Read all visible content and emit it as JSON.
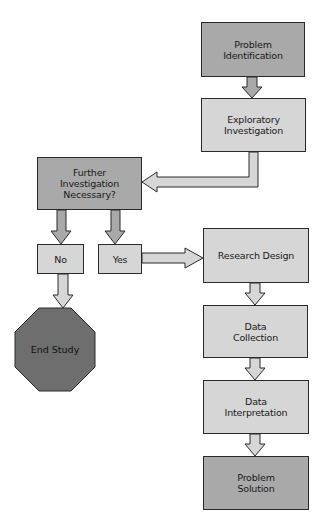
{
  "diagram": {
    "type": "flowchart",
    "colors": {
      "dark_fill": "#a9a9a9",
      "light_fill": "#d6d6d6",
      "terminal_fill": "#6e6e6e",
      "stroke": "#2a2a2a"
    },
    "nodes": {
      "problem_identification": {
        "line1": "Problem",
        "line2": "Identification"
      },
      "exploratory_investigation": {
        "line1": "Exploratory",
        "line2": "Investigation"
      },
      "further_investigation": {
        "line1": "Further",
        "line2": "Investigation",
        "line3": "Necessary?"
      },
      "no": {
        "label": "No"
      },
      "yes": {
        "label": "Yes"
      },
      "end_study": {
        "line1": "End",
        "line2": "Study"
      },
      "research_design": {
        "label": "Research Design"
      },
      "data_collection": {
        "line1": "Data",
        "line2": "Collection"
      },
      "data_interpretation": {
        "line1": "Data",
        "line2": "Interpretation"
      },
      "problem_solution": {
        "line1": "Problem",
        "line2": "Solution"
      }
    },
    "edges": [
      {
        "from": "Problem Identification",
        "to": "Exploratory Investigation"
      },
      {
        "from": "Exploratory Investigation",
        "to": "Further Investigation Necessary?"
      },
      {
        "from": "Further Investigation Necessary?",
        "to": "No"
      },
      {
        "from": "Further Investigation Necessary?",
        "to": "Yes"
      },
      {
        "from": "No",
        "to": "End Study"
      },
      {
        "from": "Yes",
        "to": "Research Design"
      },
      {
        "from": "Research Design",
        "to": "Data Collection"
      },
      {
        "from": "Data Collection",
        "to": "Data Interpretation"
      },
      {
        "from": "Data Interpretation",
        "to": "Problem Solution"
      }
    ]
  }
}
